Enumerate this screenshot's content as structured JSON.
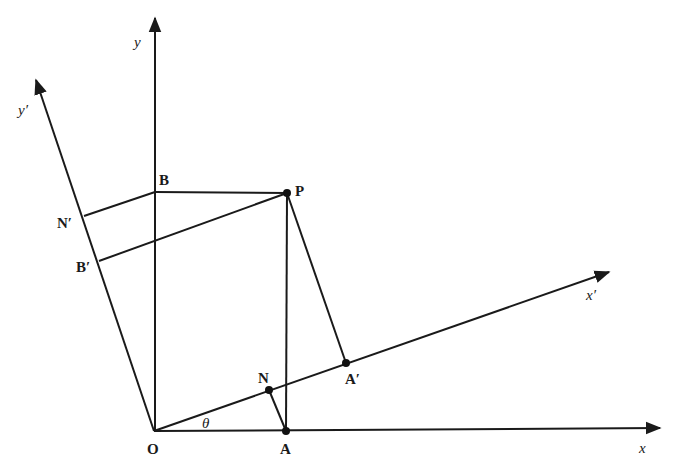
{
  "diagram": {
    "axes": {
      "x": "x",
      "y": "y",
      "x_prime": "x′",
      "y_prime": "y′"
    },
    "points": {
      "O": "O",
      "A": "A",
      "B": "B",
      "P": "P",
      "N": "N",
      "A_prime": "A′",
      "B_prime": "B′",
      "N_prime": "N′"
    },
    "angle_label": "θ",
    "colors": {
      "ink": "#1a1a1a",
      "background": "#ffffff"
    }
  }
}
